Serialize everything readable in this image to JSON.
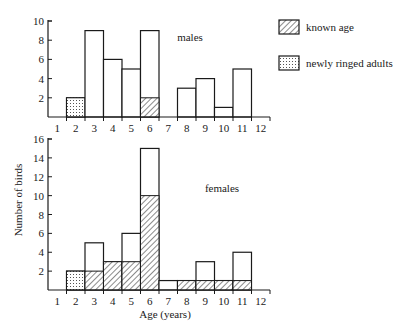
{
  "chart_data": [
    {
      "type": "bar",
      "panel": "males",
      "title": "males",
      "xlabel": "",
      "ylabel": "Number of birds",
      "categories": [
        "1",
        "2",
        "3",
        "4",
        "5",
        "6",
        "7",
        "8",
        "9",
        "10",
        "11",
        "12"
      ],
      "ylim": [
        0,
        10
      ],
      "yticks": [
        2,
        4,
        6,
        8,
        10
      ],
      "series": [
        {
          "name": "total",
          "values": [
            0,
            2,
            9,
            6,
            5,
            9,
            0,
            3,
            4,
            1,
            5,
            0
          ]
        },
        {
          "name": "known age",
          "values": [
            0,
            0,
            0,
            0,
            0,
            2,
            0,
            0,
            0,
            0,
            0,
            0
          ]
        },
        {
          "name": "newly ringed adults",
          "values": [
            0,
            2,
            0,
            0,
            0,
            0,
            0,
            0,
            0,
            0,
            0,
            0
          ]
        }
      ],
      "grid": false
    },
    {
      "type": "bar",
      "panel": "females",
      "title": "females",
      "xlabel": "Age (years)",
      "ylabel": "Number of birds",
      "categories": [
        "1",
        "2",
        "3",
        "4",
        "5",
        "6",
        "7",
        "8",
        "9",
        "10",
        "11",
        "12"
      ],
      "ylim": [
        0,
        16
      ],
      "yticks": [
        2,
        4,
        6,
        8,
        10,
        12,
        14,
        16
      ],
      "series": [
        {
          "name": "total",
          "values": [
            0,
            2,
            5,
            3,
            6,
            15,
            1,
            1,
            3,
            1,
            4,
            0
          ]
        },
        {
          "name": "known age",
          "values": [
            0,
            0,
            2,
            3,
            3,
            10,
            0,
            1,
            1,
            1,
            1,
            0
          ]
        },
        {
          "name": "newly ringed adults",
          "values": [
            0,
            2,
            0,
            0,
            0,
            0,
            0,
            0,
            0,
            0,
            0,
            0
          ]
        }
      ],
      "grid": false
    }
  ],
  "labels": {
    "males": "males",
    "females": "females",
    "ylabel": "Number of birds",
    "xlabel": "Age (years)"
  },
  "legend": {
    "position": "top-right",
    "items": [
      {
        "label": "known age",
        "pattern": "hatched"
      },
      {
        "label": "newly ringed adults",
        "pattern": "dotted"
      }
    ]
  },
  "colors": {
    "ink": "#1a1a1a",
    "background": "#ffffff"
  }
}
